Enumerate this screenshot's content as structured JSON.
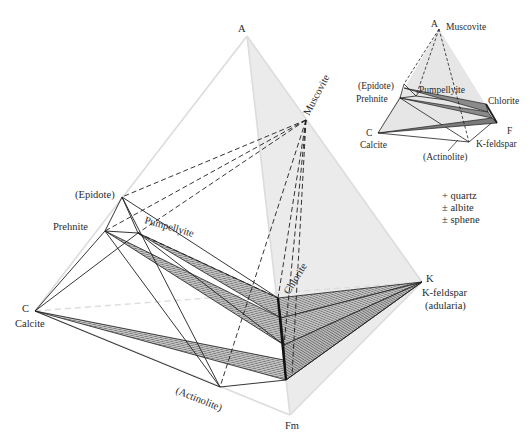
{
  "figure": {
    "type": "mineral-composition-tetrahedron",
    "main": {
      "vertices": {
        "apex_A": "A",
        "apex_C": "C",
        "apex_Fm": "Fm",
        "apex_K": "K"
      },
      "minerals": {
        "muscovite": "Muscovite",
        "epidote": "(Epidote)",
        "prehnite": "Prehnite",
        "pumpellyite": "Pumpellyite",
        "calcite": "Calcite",
        "chlorite": "Chlorite",
        "actinolite": "(Actinolite)",
        "kfeldspar": "K-feldspar",
        "adularia": "(adularia)"
      }
    },
    "inset": {
      "vertices": {
        "apex_A": "A",
        "apex_C": "C",
        "apex_F": "F"
      },
      "minerals": {
        "muscovite": "Muscovite",
        "epidote": "(Epidote)",
        "prehnite": "Prehnite",
        "pumpellyite": "Pumpellyite",
        "chlorite": "Chlorite",
        "calcite": "Calcite",
        "actinolite": "(Actinolite)",
        "kfeldspar": "K-feldspar"
      }
    },
    "legend": {
      "line1": "+ quartz",
      "line2": "± albite",
      "line3": "± sphene"
    },
    "colors": {
      "shade": "#e6e6e6",
      "line": "#1e1e1e",
      "hatch_fill": "#9a9a9a",
      "light_edge": "#d8d8d8"
    }
  }
}
